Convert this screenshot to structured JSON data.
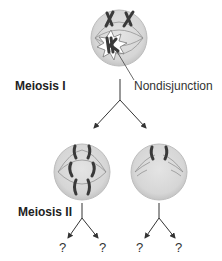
{
  "diagram": {
    "top_clipped_text": "",
    "stages": {
      "meiosis_1": "Meiosis I",
      "meiosis_2": "Meiosis II"
    },
    "annotation": "Nondisjunction",
    "outcomes": [
      "?",
      "?",
      "?",
      "?"
    ],
    "colors": {
      "cell_fill": "#d9d9d9",
      "cell_stroke": "#bcbcbc",
      "chromosome": "#3a3a3a",
      "spindle": "#8a8a8a",
      "starburst_fill": "#ffffff",
      "starburst_stroke": "#777777",
      "arrow": "#333333"
    },
    "cells": [
      {
        "id": "parent-cell",
        "stage": "Meiosis I",
        "chromosome_count": 4,
        "has_nondisjunction": true
      },
      {
        "id": "daughter-cell-left",
        "stage": "Meiosis II",
        "chromosome_count": 6
      },
      {
        "id": "daughter-cell-right",
        "stage": "Meiosis II",
        "chromosome_count": 2
      }
    ]
  }
}
